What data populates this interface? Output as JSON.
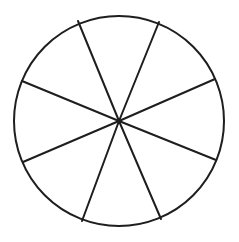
{
  "diagram": {
    "type": "divided-circle",
    "sectors": 8,
    "stroke_color": "#1e1e1e",
    "background": "#ffffff",
    "stroke_width": 2,
    "center": [
      119,
      121
    ],
    "radius": 105,
    "spoke_endpoints": [
      [
        78,
        21
      ],
      [
        159,
        22
      ],
      [
        215,
        79
      ],
      [
        216,
        160
      ],
      [
        161,
        219
      ],
      [
        82,
        221
      ],
      [
        23,
        162
      ],
      [
        22,
        81
      ]
    ]
  }
}
